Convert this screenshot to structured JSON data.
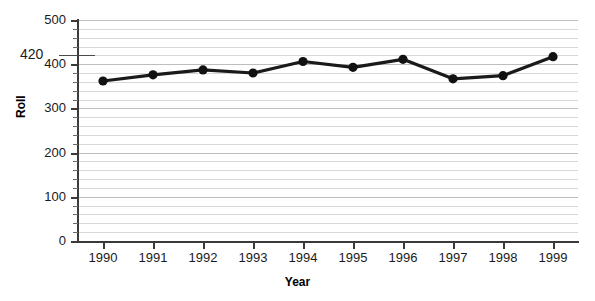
{
  "title_remnant": "",
  "axis": {
    "y_title": "Roll",
    "x_title": "Year",
    "y_ticks": [
      "0",
      "100",
      "200",
      "300",
      "400",
      "500"
    ],
    "x_ticks": [
      "1990",
      "1991",
      "1992",
      "1993",
      "1994",
      "1995",
      "1996",
      "1997",
      "1998",
      "1999"
    ]
  },
  "annotation": {
    "value_label": "420"
  },
  "style": {
    "line_color": "#1a1a1a",
    "marker_color": "#111111",
    "grid_color": "#cccccc",
    "axis_color": "#3a3a3a",
    "background": "#ffffff"
  },
  "chart_data": {
    "type": "line",
    "title": "",
    "xlabel": "Year",
    "ylabel": "Roll",
    "x": [
      1990,
      1991,
      1992,
      1993,
      1994,
      1995,
      1996,
      1997,
      1998,
      1999
    ],
    "categories": [
      "1990",
      "1991",
      "1992",
      "1993",
      "1994",
      "1995",
      "1996",
      "1997",
      "1998",
      "1999"
    ],
    "series": [
      {
        "name": "Roll",
        "values": [
          362,
          376,
          387,
          380,
          406,
          393,
          411,
          367,
          374,
          417
        ]
      }
    ],
    "ylim": [
      0,
      500
    ],
    "ytick_step": 100,
    "minor_gridline_step": 20,
    "grid": true,
    "legend": false,
    "markers": true,
    "annotations": [
      {
        "text": "420",
        "y_value": 420,
        "position": "left-outside",
        "leader_line": true
      }
    ]
  }
}
